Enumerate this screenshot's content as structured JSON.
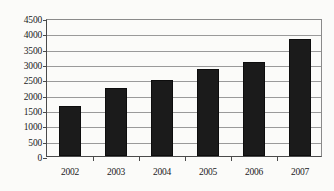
{
  "chart_data": {
    "type": "bar",
    "title": "",
    "subtitle": "",
    "xlabel": "",
    "ylabel": "",
    "categories": [
      "2002",
      "2003",
      "2004",
      "2005",
      "2006",
      "2007"
    ],
    "values": [
      1640,
      2210,
      2480,
      2830,
      3080,
      3830
    ],
    "series": [
      {
        "name": "",
        "values": [
          1640,
          2210,
          2480,
          2830,
          3080,
          3830
        ]
      }
    ],
    "ylim": [
      0,
      4500
    ],
    "ytick_step": 500,
    "yticks": [
      0,
      500,
      1000,
      1500,
      2000,
      2500,
      3000,
      3500,
      4000,
      4500
    ],
    "ytick_labels": [
      "0",
      "500",
      "1000",
      "1500",
      "2000",
      "2500",
      "3000",
      "3500",
      "4000",
      "4500"
    ],
    "grid": true,
    "grid_axis": "y",
    "legend": false,
    "legend_position": "none",
    "bar_color": "#1b1b1b",
    "plot_background": "#fbfbf9",
    "axis_color": "#4a4a4a",
    "gridline_color": "#9a9a9a"
  }
}
